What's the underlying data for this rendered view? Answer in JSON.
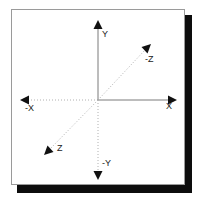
{
  "diagram": {
    "frame": {
      "border_color": "#9a9a9a",
      "background_color": "#ffffff",
      "shadow_color": "#0d0d0d"
    },
    "origin": {
      "x": 98,
      "y": 100
    },
    "colors": {
      "solid_axis": "#7a7a7a",
      "dotted_axis": "#b0b0b0",
      "arrowhead": "#111111",
      "label_text": "#1a1a1a"
    },
    "axes": [
      {
        "id": "y-positive",
        "label": "Y",
        "direction": "up",
        "line_style": "solid",
        "arrow": true,
        "tip": {
          "x": 98,
          "y": 20
        }
      },
      {
        "id": "y-negative",
        "label": "-Y",
        "direction": "down",
        "line_style": "dotted",
        "arrow": true,
        "tip": {
          "x": 98,
          "y": 180
        }
      },
      {
        "id": "x-positive",
        "label": "X",
        "direction": "right",
        "line_style": "solid",
        "arrow": true,
        "tip": {
          "x": 177,
          "y": 100
        }
      },
      {
        "id": "x-negative",
        "label": "-X",
        "direction": "left",
        "line_style": "dotted",
        "arrow": true,
        "tip": {
          "x": 20,
          "y": 100
        }
      },
      {
        "id": "z-negative",
        "label": "-Z",
        "direction": "up-right-diagonal",
        "line_style": "dotted",
        "arrow": true,
        "tip": {
          "x": 150,
          "y": 45
        }
      },
      {
        "id": "z-positive",
        "label": "Z",
        "direction": "down-left-diagonal",
        "line_style": "dotted",
        "arrow": true,
        "tip": {
          "x": 45,
          "y": 153
        }
      }
    ]
  }
}
